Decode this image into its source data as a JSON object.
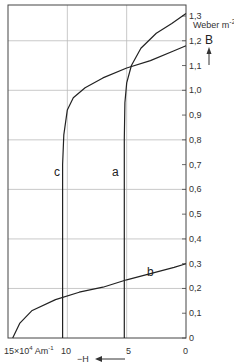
{
  "chart_data": {
    "type": "line",
    "title": "",
    "xlabel": "-H",
    "x_unit": "10^4 Am^-1",
    "ylabel": "B",
    "y_unit": "Weber m^-2",
    "xlim": [
      15,
      0
    ],
    "ylim": [
      0,
      1.3
    ],
    "x_ticks": [
      "15×10⁴ Am⁻¹",
      "10",
      "5",
      "0"
    ],
    "y_ticks": [
      "0",
      "0,1",
      "0,2",
      "0,3",
      "0,4",
      "0,5",
      "0,6",
      "0,7",
      "0,8",
      "0,9",
      "1,0",
      "1,1",
      "1,2",
      "1,3"
    ],
    "grid": true,
    "series": [
      {
        "name": "a",
        "x": [
          5.2,
          5.2,
          5.15,
          5.0,
          4.6,
          3.8,
          2.5,
          1.2,
          0
        ],
        "y": [
          0,
          0.8,
          0.95,
          1.03,
          1.1,
          1.17,
          1.23,
          1.27,
          1.31
        ]
      },
      {
        "name": "b",
        "x": [
          14.6,
          14.0,
          13.0,
          11.0,
          9.0,
          7.0,
          5.0,
          3.0,
          1.0,
          0
        ],
        "y": [
          0,
          0.06,
          0.11,
          0.155,
          0.185,
          0.205,
          0.235,
          0.26,
          0.285,
          0.3
        ]
      },
      {
        "name": "c",
        "x": [
          10.4,
          10.4,
          10.3,
          10.0,
          9.5,
          8.5,
          7.0,
          5.0,
          3.0,
          1.0,
          0
        ],
        "y": [
          0,
          0.7,
          0.82,
          0.92,
          0.97,
          1.01,
          1.05,
          1.09,
          1.12,
          1.16,
          1.18
        ]
      }
    ]
  },
  "labels": {
    "curve_a": "a",
    "curve_b": "b",
    "curve_c": "c",
    "y_axis": "B",
    "y_unit": "Weber m",
    "y_unit_sup": "-2",
    "x_axis": "−H",
    "x_first_tick": "15×10",
    "x_first_sup": "4",
    "x_first_unit": " Am",
    "x_first_unit_sup": "-1",
    "x_tick_10": "10",
    "x_tick_5": "5",
    "x_tick_0": "0"
  }
}
